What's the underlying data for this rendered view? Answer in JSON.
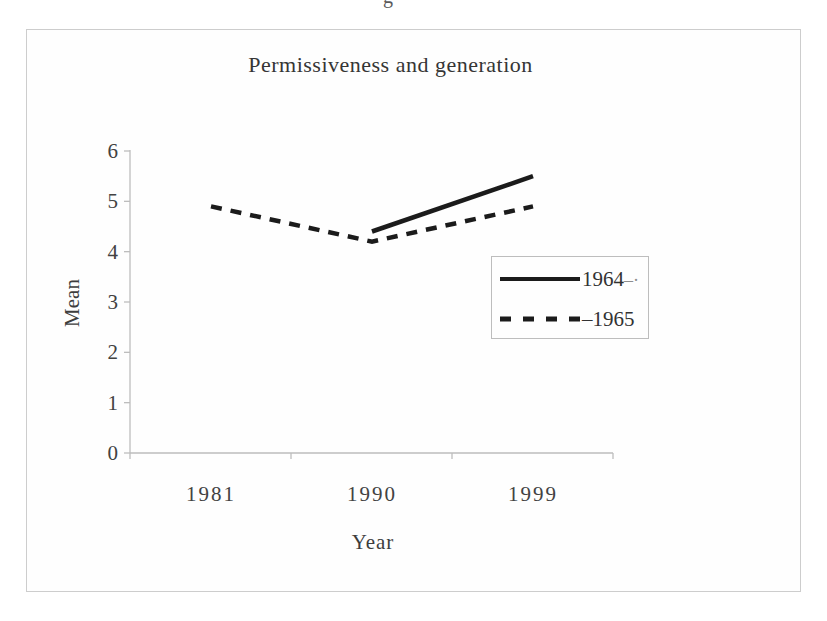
{
  "page": {
    "background": "#ffffff",
    "top_edge_fragment": "g"
  },
  "chart_data": {
    "type": "line",
    "title": "Permissiveness and generation",
    "xlabel": "Year",
    "ylabel": "Mean",
    "categories": [
      "1981",
      "1990",
      "1999"
    ],
    "y_ticks": [
      "0",
      "1",
      "2",
      "3",
      "4",
      "5",
      "6"
    ],
    "ylim": [
      0,
      6
    ],
    "grid": false,
    "legend_position": "center-right-inside",
    "axis_color": "#bdbdbd",
    "line_color": "#1b1b1b",
    "series": [
      {
        "name": "1964",
        "name_suffix": "–·",
        "line_style": "solid",
        "values": [
          null,
          4.4,
          5.5
        ]
      },
      {
        "name": "–1965",
        "name_suffix": "",
        "line_style": "dashed",
        "values": [
          4.9,
          4.2,
          4.9
        ]
      }
    ]
  }
}
